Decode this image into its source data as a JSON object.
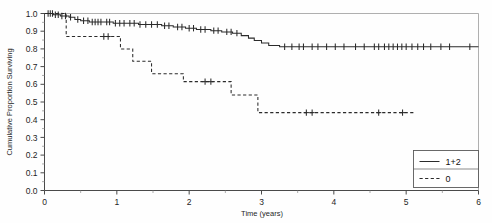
{
  "chart_data": {
    "type": "line",
    "title": "",
    "xlabel": "Time (years)",
    "ylabel": "Cumulative Proportion Surviving",
    "xlim": [
      0,
      6
    ],
    "ylim": [
      0.0,
      1.0
    ],
    "grid": false,
    "legend_position": "bottom-right",
    "xticks": [
      "0",
      "1",
      "2",
      "3",
      "4",
      "5",
      "6"
    ],
    "xtick_values": [
      0,
      1,
      2,
      3,
      4,
      5,
      6
    ],
    "yticks": [
      "0.0",
      "0.1",
      "0.2",
      "0.3",
      "0.4",
      "0.5",
      "0.6",
      "0.7",
      "0.8",
      "0.9",
      "1.0"
    ],
    "ytick_values": [
      0.0,
      0.1,
      0.2,
      0.3,
      0.4,
      0.5,
      0.6,
      0.7,
      0.8,
      0.9,
      1.0
    ],
    "legend": [
      {
        "label": "1+2",
        "style": "solid"
      },
      {
        "label": "0",
        "style": "dashed"
      }
    ],
    "series": [
      {
        "name": "1+2",
        "style": "solid",
        "steps": [
          [
            0.0,
            1.0
          ],
          [
            0.12,
            0.993
          ],
          [
            0.22,
            0.986
          ],
          [
            0.34,
            0.979
          ],
          [
            0.42,
            0.966
          ],
          [
            0.5,
            0.959
          ],
          [
            0.62,
            0.952
          ],
          [
            0.8,
            0.952
          ],
          [
            0.95,
            0.945
          ],
          [
            1.15,
            0.945
          ],
          [
            1.3,
            0.938
          ],
          [
            1.45,
            0.938
          ],
          [
            1.62,
            0.931
          ],
          [
            1.78,
            0.924
          ],
          [
            1.95,
            0.917
          ],
          [
            2.1,
            0.91
          ],
          [
            2.3,
            0.903
          ],
          [
            2.45,
            0.896
          ],
          [
            2.6,
            0.889
          ],
          [
            2.72,
            0.875
          ],
          [
            2.82,
            0.861
          ],
          [
            2.9,
            0.847
          ],
          [
            3.0,
            0.833
          ],
          [
            3.1,
            0.819
          ],
          [
            3.25,
            0.812
          ],
          [
            6.0,
            0.812
          ]
        ],
        "censor_times": [
          0.05,
          0.08,
          0.11,
          0.15,
          0.19,
          0.24,
          0.29,
          0.36,
          0.46,
          0.54,
          0.6,
          0.66,
          0.7,
          0.74,
          0.78,
          0.86,
          0.9,
          0.98,
          1.04,
          1.1,
          1.18,
          1.24,
          1.32,
          1.4,
          1.48,
          1.56,
          1.66,
          1.72,
          1.84,
          1.9,
          2.0,
          2.06,
          2.16,
          2.22,
          2.34,
          2.4,
          2.52,
          2.58,
          2.66,
          3.32,
          3.42,
          3.52,
          3.58,
          3.7,
          3.78,
          3.9,
          4.02,
          4.14,
          4.3,
          4.42,
          4.56,
          4.62,
          4.7,
          4.76,
          4.82,
          4.88,
          4.94,
          5.0,
          5.08,
          5.16,
          5.24,
          5.34,
          5.48,
          5.6,
          5.88
        ]
      },
      {
        "name": "0",
        "style": "dashed",
        "steps": [
          [
            0.0,
            1.0
          ],
          [
            0.3,
            1.0
          ],
          [
            0.3,
            0.87
          ],
          [
            1.05,
            0.87
          ],
          [
            1.05,
            0.8
          ],
          [
            1.22,
            0.8
          ],
          [
            1.22,
            0.73
          ],
          [
            1.48,
            0.73
          ],
          [
            1.48,
            0.66
          ],
          [
            1.92,
            0.66
          ],
          [
            1.92,
            0.615
          ],
          [
            2.58,
            0.615
          ],
          [
            2.58,
            0.54
          ],
          [
            2.95,
            0.54
          ],
          [
            2.95,
            0.44
          ],
          [
            5.1,
            0.44
          ]
        ],
        "censor_times": [
          0.82,
          0.88,
          2.22,
          2.3,
          3.62,
          3.7,
          4.62,
          4.95
        ]
      }
    ]
  }
}
